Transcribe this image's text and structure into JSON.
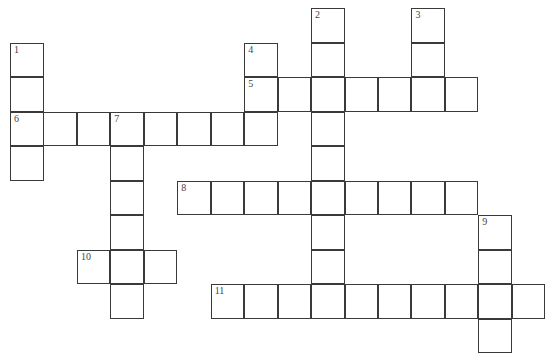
{
  "puzzle": {
    "type": "crossword",
    "origin": {
      "x": 10,
      "y": 8
    },
    "cell_size": {
      "w": 33.45,
      "h": 34.5
    },
    "cells": [
      [
        0,
        9,
        "2"
      ],
      [
        0,
        12,
        "3"
      ],
      [
        1,
        0,
        "1"
      ],
      [
        1,
        7,
        "4"
      ],
      [
        1,
        9,
        ""
      ],
      [
        1,
        12,
        ""
      ],
      [
        2,
        0,
        ""
      ],
      [
        2,
        7,
        "5"
      ],
      [
        2,
        8,
        ""
      ],
      [
        2,
        9,
        ""
      ],
      [
        2,
        10,
        ""
      ],
      [
        2,
        11,
        ""
      ],
      [
        2,
        12,
        ""
      ],
      [
        2,
        13,
        ""
      ],
      [
        3,
        0,
        "6"
      ],
      [
        3,
        1,
        ""
      ],
      [
        3,
        2,
        ""
      ],
      [
        3,
        3,
        "7"
      ],
      [
        3,
        4,
        ""
      ],
      [
        3,
        5,
        ""
      ],
      [
        3,
        6,
        ""
      ],
      [
        3,
        7,
        ""
      ],
      [
        3,
        9,
        ""
      ],
      [
        4,
        0,
        ""
      ],
      [
        4,
        3,
        ""
      ],
      [
        4,
        9,
        ""
      ],
      [
        5,
        3,
        ""
      ],
      [
        5,
        5,
        "8"
      ],
      [
        5,
        6,
        ""
      ],
      [
        5,
        7,
        ""
      ],
      [
        5,
        8,
        ""
      ],
      [
        5,
        9,
        ""
      ],
      [
        5,
        10,
        ""
      ],
      [
        5,
        11,
        ""
      ],
      [
        5,
        12,
        ""
      ],
      [
        5,
        13,
        ""
      ],
      [
        6,
        3,
        ""
      ],
      [
        6,
        9,
        ""
      ],
      [
        6,
        14,
        "9"
      ],
      [
        7,
        2,
        "10"
      ],
      [
        7,
        3,
        ""
      ],
      [
        7,
        4,
        ""
      ],
      [
        7,
        9,
        ""
      ],
      [
        7,
        14,
        ""
      ],
      [
        8,
        3,
        ""
      ],
      [
        8,
        6,
        "11"
      ],
      [
        8,
        7,
        ""
      ],
      [
        8,
        8,
        ""
      ],
      [
        8,
        9,
        ""
      ],
      [
        8,
        10,
        ""
      ],
      [
        8,
        11,
        ""
      ],
      [
        8,
        12,
        ""
      ],
      [
        8,
        13,
        ""
      ],
      [
        8,
        14,
        ""
      ],
      [
        8,
        15,
        ""
      ],
      [
        9,
        14,
        ""
      ]
    ]
  }
}
